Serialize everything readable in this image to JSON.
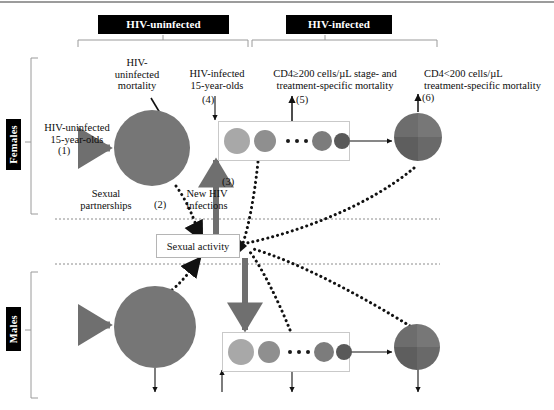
{
  "figure": {
    "type": "compartmental-flow-diagram"
  },
  "headers": [
    {
      "id": "hiv-uninfected",
      "label": "HIV-uninfected"
    },
    {
      "id": "hiv-infected",
      "label": "HIV-infected"
    }
  ],
  "sex_groups": [
    {
      "id": "females",
      "label": "Females"
    },
    {
      "id": "males",
      "label": "Males"
    }
  ],
  "annotations": {
    "uninfected_mortality": "HIV-\nuninfected\nmortality",
    "uninfected_entrants": "HIV-uninfected\n15-year-olds",
    "infected_entrants": "HIV-infected\n15-year-olds",
    "cd4_high_mortality": "CD4≥200 cells/µL stage- and\ntreatment-specific mortality",
    "cd4_low_mortality": "CD4<200 cells/µL\ntreatment-specific mortality",
    "sexual_partnerships": "Sexual\npartnerships",
    "new_hiv_infections": "New HIV\ninfections",
    "sexual_activity": "Sexual activity"
  },
  "flow_numbers": {
    "n1": "(1)",
    "n2": "(2)",
    "n3": "(3)",
    "n4": "(4)",
    "n5": "(5)",
    "n6": "(6)"
  },
  "colors": {
    "chip_bg": "#000000",
    "chip_text": "#ffffff",
    "page_bg": "#ffffff",
    "big_circle": "#767676",
    "gray_arrow": "#7a7a7a",
    "thick_arrow": "#6f6f6f",
    "box_border": "#c9c9c9",
    "dashed_line": "#8c8c8c",
    "bracket": "#9a9a9a",
    "text": "#111111",
    "stage_1": "#a8a8a8",
    "stage_2": "#8f8f8f",
    "stage_3": "#7c7c7c",
    "stage_4": "#595959",
    "quad_a": "#6d6d6d",
    "quad_b": "#777777",
    "quad_c": "#5e5e5e",
    "quad_d": "#696969"
  },
  "compartments": {
    "uninfected_circle": {
      "name": "HIV-uninfected population",
      "radius_px": 38
    },
    "cd4_high_stages": [
      {
        "shade_key": "stage_1",
        "size_px": 25
      },
      {
        "shade_key": "stage_2",
        "size_px": 22
      },
      {
        "shade_key": "stage_3",
        "size_px": 19
      },
      {
        "shade_key": "stage_4",
        "size_px": 16
      }
    ],
    "cd4_low_circle": {
      "name": "CD4<200 treatment compartment",
      "radius_px": 24
    }
  }
}
